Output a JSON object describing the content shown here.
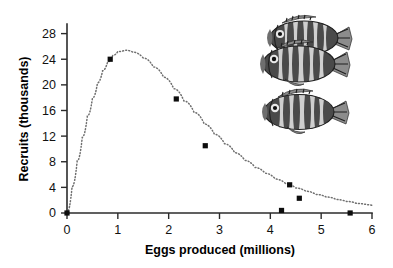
{
  "figure": {
    "background_color": "#ffffff",
    "illustration": {
      "name": "three-sunfish-illustration",
      "subject": "sunfish",
      "count": 3,
      "style": "grayscale line engraving",
      "description": "Three deep-bodied sunfish with vertical barred markings"
    }
  },
  "chart_data": {
    "type": "scatter",
    "title": "",
    "subtitle": "",
    "xlabel": "Eggs produced (millions)",
    "ylabel": "Recruits (thousands)",
    "xlim": [
      0,
      6
    ],
    "ylim": [
      0,
      29.5
    ],
    "xticks": [
      0,
      1,
      2,
      3,
      4,
      5,
      6
    ],
    "xtick_labels": [
      "0",
      "1",
      "2",
      "3",
      "4",
      "5",
      "6"
    ],
    "yticks": [
      0,
      4,
      8,
      12,
      16,
      20,
      24,
      28
    ],
    "ytick_labels": [
      "0",
      "4",
      "8",
      "12",
      "16",
      "20",
      "24",
      "28"
    ],
    "grid": false,
    "legend": null,
    "legend_position": "none",
    "series": [
      {
        "name": "Observed stock-recruitment points",
        "marker": "square",
        "color": "#0d0d0d",
        "points": [
          {
            "x": 0.0,
            "y": 0.0
          },
          {
            "x": 0.85,
            "y": 24.0
          },
          {
            "x": 2.15,
            "y": 17.8
          },
          {
            "x": 2.72,
            "y": 10.5
          },
          {
            "x": 4.22,
            "y": 0.4
          },
          {
            "x": 4.38,
            "y": 4.4
          },
          {
            "x": 4.57,
            "y": 2.3
          },
          {
            "x": 5.57,
            "y": 0.0
          }
        ]
      },
      {
        "name": "Ricker fitted curve",
        "marker": "none",
        "line_style": "dotted",
        "color": "#6f6f6f",
        "points": [
          {
            "x": 0.0,
            "y": 0.0
          },
          {
            "x": 0.1,
            "y": 4.1
          },
          {
            "x": 0.2,
            "y": 8.1
          },
          {
            "x": 0.3,
            "y": 11.8
          },
          {
            "x": 0.4,
            "y": 15.1
          },
          {
            "x": 0.5,
            "y": 17.9
          },
          {
            "x": 0.6,
            "y": 20.3
          },
          {
            "x": 0.7,
            "y": 22.2
          },
          {
            "x": 0.8,
            "y": 23.6
          },
          {
            "x": 0.9,
            "y": 24.6
          },
          {
            "x": 1.0,
            "y": 25.2
          },
          {
            "x": 1.15,
            "y": 25.4
          },
          {
            "x": 1.3,
            "y": 25.1
          },
          {
            "x": 1.5,
            "y": 24.2
          },
          {
            "x": 1.7,
            "y": 22.8
          },
          {
            "x": 1.9,
            "y": 21.2
          },
          {
            "x": 2.1,
            "y": 19.4
          },
          {
            "x": 2.3,
            "y": 17.5
          },
          {
            "x": 2.5,
            "y": 15.7
          },
          {
            "x": 2.7,
            "y": 13.9
          },
          {
            "x": 2.9,
            "y": 12.3
          },
          {
            "x": 3.1,
            "y": 10.8
          },
          {
            "x": 3.3,
            "y": 9.4
          },
          {
            "x": 3.5,
            "y": 8.2
          },
          {
            "x": 3.7,
            "y": 7.1
          },
          {
            "x": 3.9,
            "y": 6.2
          },
          {
            "x": 4.1,
            "y": 5.3
          },
          {
            "x": 4.3,
            "y": 4.6
          },
          {
            "x": 4.5,
            "y": 3.9
          },
          {
            "x": 4.7,
            "y": 3.4
          },
          {
            "x": 4.9,
            "y": 2.9
          },
          {
            "x": 5.1,
            "y": 2.5
          },
          {
            "x": 5.3,
            "y": 2.1
          },
          {
            "x": 5.5,
            "y": 1.8
          },
          {
            "x": 5.7,
            "y": 1.5
          },
          {
            "x": 5.9,
            "y": 1.3
          },
          {
            "x": 6.0,
            "y": 1.2
          }
        ]
      }
    ]
  }
}
